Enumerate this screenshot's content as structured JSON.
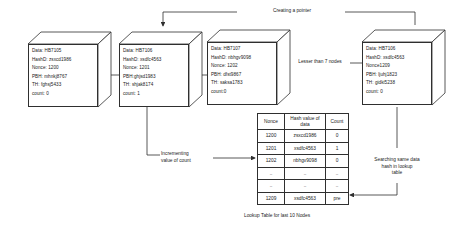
{
  "diagram": {
    "nodes": [
      {
        "id": "node-1",
        "lines": [
          "Data: HB7105",
          "HashD: zsxcd1986",
          "Nonce: 1200",
          "PBH: mhnkj8767",
          "TH: fghsj5433",
          "count: 0"
        ]
      },
      {
        "id": "node-2",
        "lines": [
          "Data: HB7106",
          "HashD: xsdfc4563",
          "Nonce: 1201",
          "PBH:ghjsd1983",
          "TH: shjak8174",
          "count: 1"
        ]
      },
      {
        "id": "node-3",
        "lines": [
          "Data: HB7107",
          "HashD: nbhgv9098",
          "Nonce: 1202",
          "PBH: dfst9867",
          "TH: saksa1783",
          "count:0"
        ]
      },
      {
        "id": "node-4",
        "lines": [
          "Data: HB7106",
          "HashD: xsdfc4563",
          "Nonce1209",
          "PBH: ljuhj1823",
          "TH: gidki5238",
          "count: 0"
        ]
      }
    ],
    "annotations": {
      "creating_pointer": "Creating a pointer",
      "lesser_than": "Lesser than 7 nodes",
      "incrementing": "Incrementing\nvalue of count",
      "incrementing_l1": "Incrementing",
      "incrementing_l2": "value of count",
      "searching_l1": "Searching same data",
      "searching_l2": "hash in lookup",
      "searching_l3": "table"
    },
    "lookup_table": {
      "caption": "Lookup Table for last 10 Nodes",
      "headers": [
        "Nonce",
        "Hash value of data",
        "Count"
      ],
      "header_hash_l1": "Hash value of",
      "header_hash_l2": "data",
      "rows": [
        [
          "1200",
          "zsxcd1986",
          "0"
        ],
        [
          "1201",
          "xsdfc4563",
          "1"
        ],
        [
          "1202",
          "nbhgv9098",
          "0"
        ],
        [
          "..",
          "..",
          ".."
        ],
        [
          "..",
          "..",
          ".."
        ],
        [
          "1209",
          "xsdfc4563",
          "pre"
        ]
      ]
    },
    "colors": {
      "stroke": "#2f2f2f",
      "text": "#1b1b1b",
      "background": "#ffffff"
    }
  }
}
